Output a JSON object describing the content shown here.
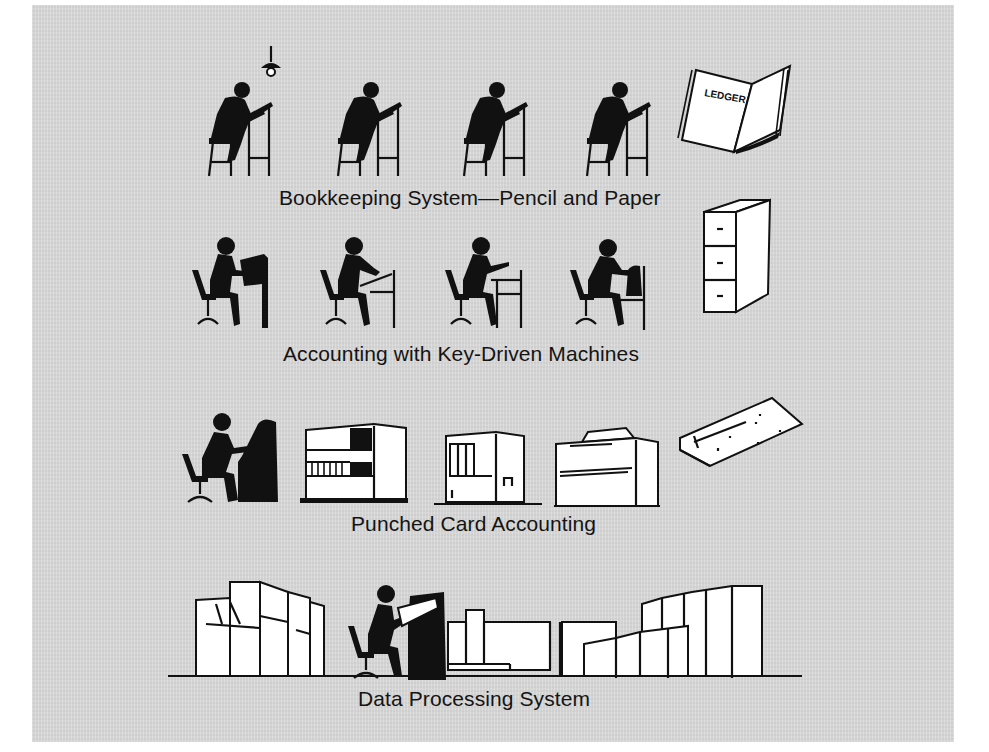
{
  "figure": {
    "background_color": "#d9d9d9",
    "ink_color": "#111111",
    "stages": [
      {
        "caption": "Bookkeeping System—Pencil and Paper",
        "figures": [
          "clerk-on-stool",
          "clerk-on-stool",
          "clerk-on-stool",
          "clerk-on-stool"
        ],
        "props": [
          "hanging-lamp",
          "ledger-book"
        ],
        "ledger_label": "LEDGER"
      },
      {
        "caption": "Accounting with Key-Driven Machines",
        "figures": [
          "operator-at-desk",
          "operator-at-desk",
          "operator-at-desk",
          "operator-at-desk"
        ],
        "props": [
          "filing-cabinet"
        ]
      },
      {
        "caption": "Punched Card Accounting",
        "figures": [
          "keypunch-operator"
        ],
        "props": [
          "card-sorter",
          "card-collator",
          "tabulator",
          "punched-card"
        ]
      },
      {
        "caption": "Data Processing System",
        "figures": [
          "console-operator"
        ],
        "props": [
          "computer-units-left",
          "computer-units-center",
          "computer-units-right"
        ]
      }
    ]
  }
}
